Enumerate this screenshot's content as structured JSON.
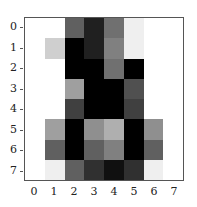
{
  "chart_data": {
    "type": "heatmap",
    "title": "",
    "xlabel": "",
    "ylabel": "",
    "colormap": "gray_r",
    "vmin": 0,
    "vmax": 16,
    "x_ticks": [
      "0",
      "1",
      "2",
      "3",
      "4",
      "5",
      "6",
      "7"
    ],
    "y_ticks": [
      "0",
      "1",
      "2",
      "3",
      "4",
      "5",
      "6",
      "7"
    ],
    "values": [
      [
        0,
        0,
        10,
        14,
        9,
        1,
        0,
        0
      ],
      [
        0,
        3,
        16,
        14,
        8,
        1,
        0,
        0
      ],
      [
        0,
        0,
        16,
        16,
        9,
        16,
        0,
        0
      ],
      [
        0,
        0,
        6,
        16,
        16,
        11,
        0,
        0
      ],
      [
        0,
        0,
        12,
        16,
        16,
        12,
        0,
        0
      ],
      [
        0,
        6,
        16,
        7,
        5,
        16,
        7,
        0
      ],
      [
        0,
        10,
        16,
        10,
        8,
        16,
        10,
        0
      ],
      [
        0,
        1,
        10,
        13,
        15,
        13,
        1,
        0
      ]
    ]
  }
}
